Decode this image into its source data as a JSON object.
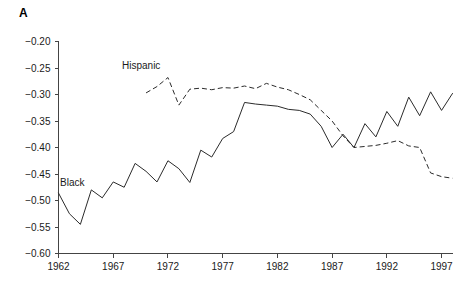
{
  "figure": {
    "panel_letter": "A"
  },
  "chart_data": {
    "type": "line",
    "title": "",
    "subtitle": "",
    "xlabel": "",
    "ylabel": "",
    "xlim": [
      1962,
      1998
    ],
    "ylim": [
      -0.6,
      -0.2
    ],
    "xticks": [
      1962,
      1967,
      1972,
      1977,
      1982,
      1987,
      1992,
      1997
    ],
    "xtick_labels": [
      "1962",
      "1967",
      "1972",
      "1977",
      "1982",
      "1987",
      "1992",
      "1997"
    ],
    "yticks": [
      -0.2,
      -0.25,
      -0.3,
      -0.35,
      -0.4,
      -0.45,
      -0.5,
      -0.55,
      -0.6
    ],
    "ytick_labels": [
      "−0.20",
      "−0.25",
      "−0.30",
      "−0.35",
      "−0.40",
      "−0.45",
      "−0.50",
      "−0.55",
      "−0.60"
    ],
    "grid": false,
    "legend_position": "inline-annotation",
    "series": [
      {
        "name": "Black",
        "style": "solid",
        "color": "#2b2b2b",
        "annotation_label": "Black",
        "x": [
          1962,
          1963,
          1964,
          1965,
          1966,
          1967,
          1968,
          1969,
          1970,
          1971,
          1972,
          1973,
          1974,
          1975,
          1976,
          1977,
          1978,
          1979,
          1980,
          1981,
          1982,
          1983,
          1984,
          1985,
          1986,
          1987,
          1988,
          1989,
          1990,
          1991,
          1992,
          1993,
          1994,
          1995,
          1996,
          1997,
          1998
        ],
        "values": [
          -0.486,
          -0.525,
          -0.545,
          -0.48,
          -0.495,
          -0.465,
          -0.475,
          -0.43,
          -0.445,
          -0.465,
          -0.425,
          -0.44,
          -0.466,
          -0.405,
          -0.418,
          -0.383,
          -0.37,
          -0.315,
          -0.318,
          -0.32,
          -0.322,
          -0.328,
          -0.33,
          -0.337,
          -0.36,
          -0.4,
          -0.375,
          -0.4,
          -0.355,
          -0.38,
          -0.332,
          -0.36,
          -0.305,
          -0.34,
          -0.295,
          -0.33,
          -0.298
        ]
      },
      {
        "name": "Hispanic",
        "style": "dashed",
        "color": "#2b2b2b",
        "annotation_label": "Hispanic",
        "x": [
          1970,
          1971,
          1972,
          1973,
          1974,
          1975,
          1976,
          1977,
          1978,
          1979,
          1980,
          1981,
          1982,
          1983,
          1984,
          1985,
          1986,
          1987,
          1988,
          1989,
          1990,
          1991,
          1992,
          1993,
          1994,
          1995,
          1996,
          1997,
          1998
        ],
        "values": [
          -0.297,
          -0.285,
          -0.268,
          -0.32,
          -0.29,
          -0.288,
          -0.291,
          -0.287,
          -0.288,
          -0.284,
          -0.289,
          -0.279,
          -0.286,
          -0.291,
          -0.3,
          -0.31,
          -0.33,
          -0.35,
          -0.378,
          -0.4,
          -0.398,
          -0.396,
          -0.392,
          -0.387,
          -0.397,
          -0.4,
          -0.448,
          -0.455,
          -0.458
        ]
      }
    ]
  }
}
